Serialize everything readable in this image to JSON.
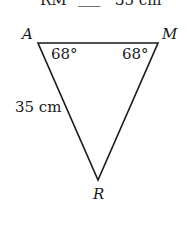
{
  "header": {
    "segment_label": "RM",
    "relation": "=",
    "value": "35 cm"
  },
  "diagram": {
    "vertices": [
      {
        "name": "A",
        "x": 38,
        "y": 43
      },
      {
        "name": "M",
        "x": 158,
        "y": 43
      },
      {
        "name": "R",
        "x": 98,
        "y": 180
      }
    ],
    "angles": {
      "A": "68°",
      "M": "68°"
    },
    "side_labels": {
      "AR": "35 cm"
    },
    "stroke_color": "#1a1a1a"
  }
}
